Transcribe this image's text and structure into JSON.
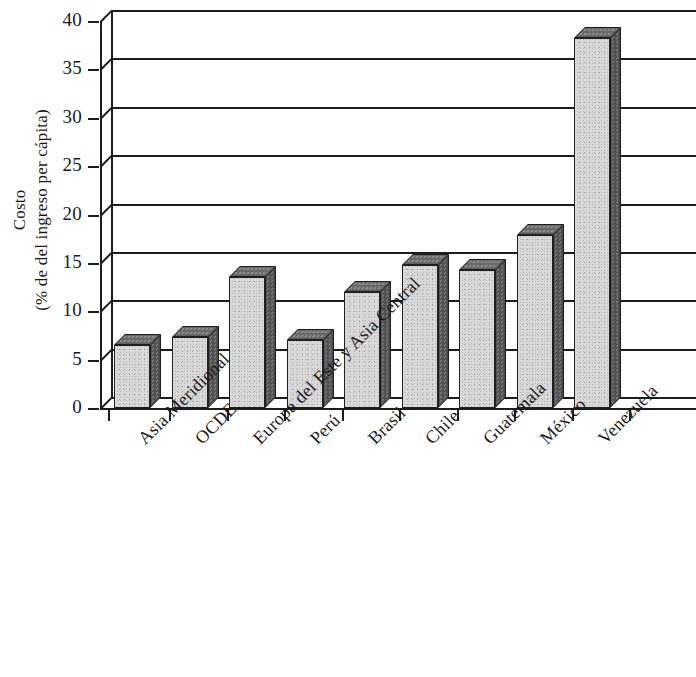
{
  "chart_data": {
    "type": "bar",
    "title": "",
    "subtitle": "",
    "xlabel": "",
    "ylabel": "Costo (% de del ingreso per cápita)",
    "ylabel_lines": [
      "Costo",
      "(% de del ingreso per cápita)"
    ],
    "categories": [
      "Asia Meridional",
      "OCDE",
      "Europa del Este y Asia Central",
      "Perú",
      "Brasil",
      "Chile",
      "Guatemala",
      "México",
      "Venezuela"
    ],
    "values": [
      6.5,
      7.3,
      13.5,
      7.0,
      12.0,
      14.8,
      14.3,
      17.9,
      38.2
    ],
    "ylim": [
      0,
      40
    ],
    "ytick_values": [
      0,
      5,
      10,
      15,
      20,
      25,
      30,
      35,
      40
    ],
    "ytick_labels": [
      "0",
      "5",
      "10",
      "15",
      "20",
      "25",
      "30",
      "35",
      "40"
    ],
    "grid": true,
    "grid_axis": "y",
    "legend": false,
    "legend_position": "none",
    "style": "3d-column",
    "colors": {
      "bar_front": "#d9d9d9",
      "bar_side": "#565656",
      "bar_top": "#6e6e6e",
      "axis": "#1d1d1d",
      "background": "#ffffff",
      "text": "#1a1a1a"
    }
  }
}
